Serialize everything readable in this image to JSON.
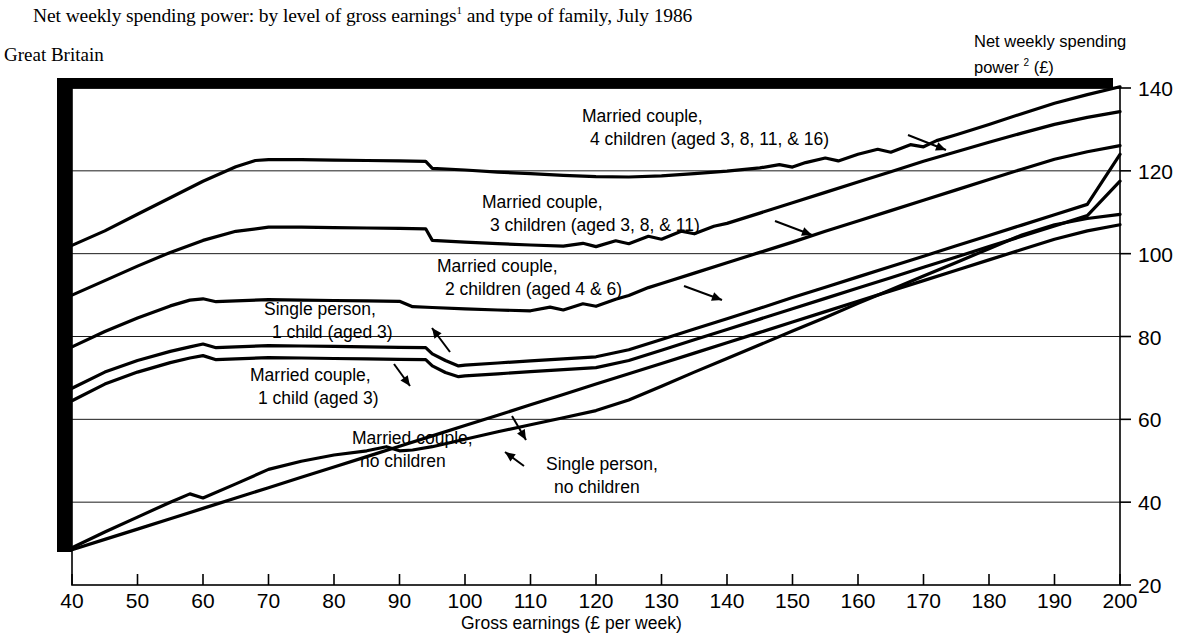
{
  "header": {
    "title_main": "Net weekly spending power: by level of gross earnings",
    "title_footnote_marker": "1",
    "title_rest": " and type  of family, July 1986",
    "region": "Great Britain"
  },
  "chart_data": {
    "type": "line",
    "title": "Net weekly spending power: by level of gross earnings1 and type of family, July 1986",
    "subtitle": "Great Britain",
    "xlabel": "Gross earnings (£ per week)",
    "ylabel_line1": "Net weekly spending",
    "ylabel_line2_pre": "power ",
    "ylabel_footnote_marker": "2",
    "ylabel_line2_post": " (£)",
    "ylabel": "Net weekly spending power 2 (£)",
    "xlim": [
      40,
      200
    ],
    "ylim": [
      20,
      140
    ],
    "xticks": [
      40,
      50,
      60,
      70,
      80,
      90,
      100,
      110,
      120,
      130,
      140,
      150,
      160,
      170,
      180,
      190,
      200
    ],
    "yticks": [
      20,
      40,
      60,
      80,
      100,
      120,
      140
    ],
    "grid": "horizontal",
    "legend_position": "inline-annotations",
    "series": [
      {
        "name": "Married couple, 4 children (aged 3, 8, 11, & 16)",
        "label_line1": "Married couple,",
        "label_line2": "4 children (aged 3, 8, 11, & 16)",
        "x": [
          40,
          45,
          50,
          55,
          60,
          65,
          68,
          70,
          75,
          80,
          85,
          90,
          94,
          95,
          100,
          105,
          110,
          115,
          120,
          125,
          130,
          135,
          140,
          145,
          148,
          150,
          152,
          155,
          157,
          160,
          163,
          165,
          168,
          170,
          172,
          175,
          180,
          185,
          190,
          195,
          200
        ],
        "y": [
          102.0,
          105.5,
          109.5,
          113.5,
          117.5,
          121.0,
          122.5,
          122.7,
          122.7,
          122.6,
          122.5,
          122.4,
          122.3,
          120.6,
          120.2,
          119.7,
          119.3,
          118.9,
          118.6,
          118.5,
          118.8,
          119.3,
          119.9,
          120.7,
          121.5,
          120.9,
          122.0,
          123.1,
          122.4,
          124.0,
          125.2,
          124.5,
          126.3,
          125.8,
          127.3,
          128.7,
          131.2,
          133.8,
          136.3,
          138.4,
          140.3
        ]
      },
      {
        "name": "Married couple, 3 children (aged 3, 8, & 11)",
        "label_line1": "Married couple,",
        "label_line2": "3 children (aged 3, 8, & 11)",
        "x": [
          40,
          45,
          50,
          55,
          60,
          65,
          70,
          75,
          80,
          85,
          90,
          94,
          95,
          100,
          105,
          110,
          115,
          118,
          120,
          123,
          125,
          128,
          130,
          133,
          135,
          138,
          140,
          145,
          150,
          155,
          160,
          165,
          170,
          175,
          180,
          185,
          190,
          195,
          200
        ],
        "y": [
          90.0,
          93.5,
          97.0,
          100.3,
          103.2,
          105.4,
          106.4,
          106.4,
          106.3,
          106.2,
          106.1,
          106.0,
          103.2,
          102.8,
          102.4,
          102.1,
          101.8,
          102.5,
          101.7,
          103.1,
          102.4,
          104.2,
          103.5,
          105.4,
          104.8,
          106.6,
          107.3,
          109.8,
          112.3,
          114.8,
          117.3,
          119.8,
          122.3,
          124.6,
          126.9,
          129.1,
          131.2,
          132.9,
          134.3
        ]
      },
      {
        "name": "Married couple, 2 children (aged 4 & 6)",
        "label_line1": "Married couple,",
        "label_line2": "2 children (aged 4 & 6)",
        "x": [
          40,
          45,
          50,
          55,
          58,
          60,
          62,
          65,
          70,
          75,
          80,
          85,
          90,
          92,
          95,
          100,
          105,
          110,
          113,
          115,
          118,
          120,
          123,
          125,
          128,
          130,
          135,
          140,
          145,
          150,
          155,
          160,
          165,
          170,
          175,
          180,
          185,
          190,
          195,
          200
        ],
        "y": [
          77.5,
          81.2,
          84.5,
          87.4,
          88.8,
          89.1,
          88.4,
          88.6,
          88.9,
          88.8,
          88.7,
          88.6,
          88.5,
          87.2,
          87.0,
          86.7,
          86.4,
          86.2,
          87.1,
          86.4,
          87.9,
          87.3,
          89.0,
          89.9,
          91.8,
          92.8,
          95.3,
          97.8,
          100.3,
          102.8,
          105.4,
          107.9,
          110.4,
          112.9,
          115.4,
          117.9,
          120.4,
          122.8,
          124.6,
          126.1
        ]
      },
      {
        "name": "Single person, 1 child (aged 3)",
        "label_line1": "Single person,",
        "label_line2": "1 child (aged 3)",
        "x": [
          40,
          45,
          50,
          55,
          58,
          60,
          62,
          65,
          70,
          75,
          80,
          85,
          90,
          94,
          95,
          97,
          99,
          100,
          105,
          110,
          115,
          120,
          125,
          130,
          135,
          140,
          145,
          150,
          155,
          160,
          165,
          170,
          175,
          180,
          185,
          190,
          195,
          200
        ],
        "y": [
          67.5,
          71.4,
          74.2,
          76.4,
          77.5,
          78.2,
          77.3,
          77.5,
          77.8,
          77.7,
          77.6,
          77.5,
          77.4,
          77.3,
          75.8,
          74.2,
          72.9,
          73.1,
          73.6,
          74.1,
          74.6,
          75.1,
          76.8,
          79.3,
          81.8,
          84.3,
          86.8,
          89.4,
          91.9,
          94.4,
          96.9,
          99.4,
          101.9,
          104.4,
          106.9,
          109.4,
          111.9,
          124.0
        ]
      },
      {
        "name": "Married couple, 1 child (aged 3)",
        "label_line1": "Married couple,",
        "label_line2": "1 child (aged 3)",
        "x": [
          40,
          45,
          50,
          55,
          58,
          60,
          62,
          65,
          70,
          75,
          80,
          85,
          90,
          94,
          95,
          97,
          99,
          100,
          105,
          110,
          115,
          120,
          125,
          130,
          135,
          140,
          145,
          150,
          155,
          160,
          165,
          170,
          175,
          180,
          185,
          190,
          195,
          200
        ],
        "y": [
          64.5,
          68.5,
          71.4,
          73.7,
          74.8,
          75.4,
          74.4,
          74.6,
          74.9,
          74.8,
          74.7,
          74.6,
          74.5,
          74.4,
          72.9,
          71.3,
          70.3,
          70.5,
          71.0,
          71.5,
          72.0,
          72.5,
          74.2,
          76.7,
          79.2,
          81.7,
          84.2,
          86.7,
          89.2,
          91.7,
          94.2,
          96.7,
          99.2,
          101.7,
          104.2,
          106.7,
          109.2,
          117.5
        ]
      },
      {
        "name": "Married couple, no children",
        "label_line1": "Married couple,",
        "label_line2": "no children",
        "x": [
          40,
          45,
          50,
          55,
          58,
          60,
          65,
          70,
          75,
          80,
          85,
          88,
          90,
          92,
          95,
          100,
          105,
          110,
          115,
          120,
          125,
          130,
          135,
          140,
          145,
          150,
          155,
          160,
          165,
          170,
          175,
          180,
          185,
          190,
          195,
          200
        ],
        "y": [
          29.0,
          32.8,
          36.4,
          40.0,
          42.0,
          41.0,
          44.4,
          47.9,
          49.9,
          51.4,
          52.4,
          53.4,
          52.4,
          52.6,
          53.4,
          55.2,
          57.0,
          58.7,
          60.4,
          62.1,
          64.7,
          68.0,
          71.4,
          74.7,
          78.0,
          81.3,
          84.6,
          88.0,
          91.3,
          94.6,
          97.9,
          101.2,
          104.5,
          107.0,
          108.5,
          109.5
        ]
      },
      {
        "name": "Single person, no children",
        "label_line1": "Single person,",
        "label_line2": "no children",
        "x": [
          40,
          45,
          50,
          55,
          60,
          65,
          70,
          75,
          80,
          85,
          90,
          95,
          100,
          105,
          110,
          115,
          120,
          125,
          130,
          135,
          140,
          145,
          150,
          155,
          160,
          165,
          170,
          175,
          180,
          185,
          190,
          195,
          200
        ],
        "y": [
          28.5,
          31.0,
          33.5,
          36.0,
          38.5,
          41.0,
          43.5,
          46.0,
          48.5,
          51.0,
          53.5,
          56.0,
          58.5,
          61.0,
          63.5,
          66.0,
          68.5,
          71.0,
          73.5,
          76.0,
          78.5,
          81.0,
          83.5,
          86.0,
          88.5,
          91.0,
          93.5,
          96.0,
          98.5,
          101.0,
          103.5,
          105.5,
          107.0
        ]
      }
    ]
  }
}
